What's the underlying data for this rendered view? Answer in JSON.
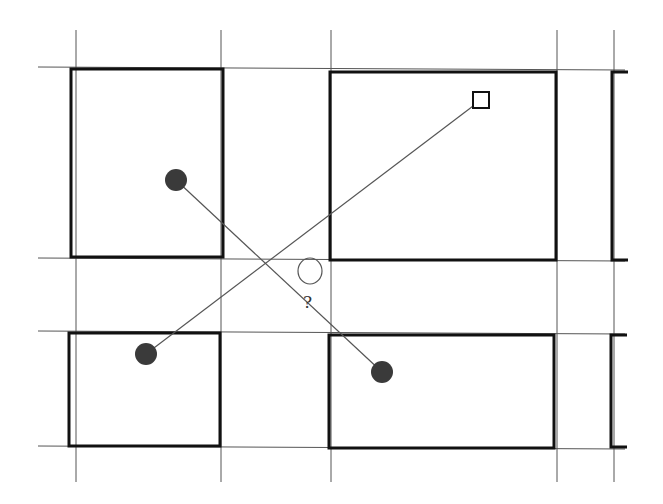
{
  "diagram": {
    "title": "",
    "question_label": "?",
    "colors": {
      "background": "#ffffff",
      "grid_line": "#555555",
      "block_border": "#111111",
      "dot_fill": "#3a3a3a",
      "connector": "#555555"
    },
    "grid_lines": {
      "vertical_x": [
        76,
        221,
        331,
        557,
        614
      ],
      "horizontal_y": [
        67,
        258,
        331,
        446
      ]
    },
    "blocks": [
      {
        "id": "block-top-left",
        "x": 71,
        "y": 69,
        "w": 152,
        "h": 188
      },
      {
        "id": "block-top-middle",
        "x": 330,
        "y": 72,
        "w": 226,
        "h": 188
      },
      {
        "id": "block-top-right-partial",
        "x": 612,
        "y": 72,
        "w": 40,
        "h": 188
      },
      {
        "id": "block-bottom-left",
        "x": 69,
        "y": 333,
        "w": 151,
        "h": 113
      },
      {
        "id": "block-bottom-middle",
        "x": 329,
        "y": 335,
        "w": 225,
        "h": 113
      },
      {
        "id": "block-bottom-right-partial",
        "x": 611,
        "y": 335,
        "w": 40,
        "h": 112
      }
    ],
    "points": [
      {
        "id": "dot-top-left",
        "shape": "filled-circle",
        "x": 176,
        "y": 180
      },
      {
        "id": "dot-bottom-left",
        "shape": "filled-circle",
        "x": 146,
        "y": 354
      },
      {
        "id": "dot-bottom-middle",
        "shape": "filled-circle",
        "x": 382,
        "y": 372
      },
      {
        "id": "square-top-right",
        "shape": "open-square",
        "x": 481,
        "y": 100
      }
    ],
    "target": {
      "id": "question-intersection",
      "x": 310,
      "y": 271,
      "rx": 12,
      "ry": 13
    },
    "connectors": [
      {
        "from": "dot-top-left",
        "to": "dot-bottom-middle"
      },
      {
        "from": "dot-bottom-left",
        "to": "square-top-right"
      }
    ]
  }
}
